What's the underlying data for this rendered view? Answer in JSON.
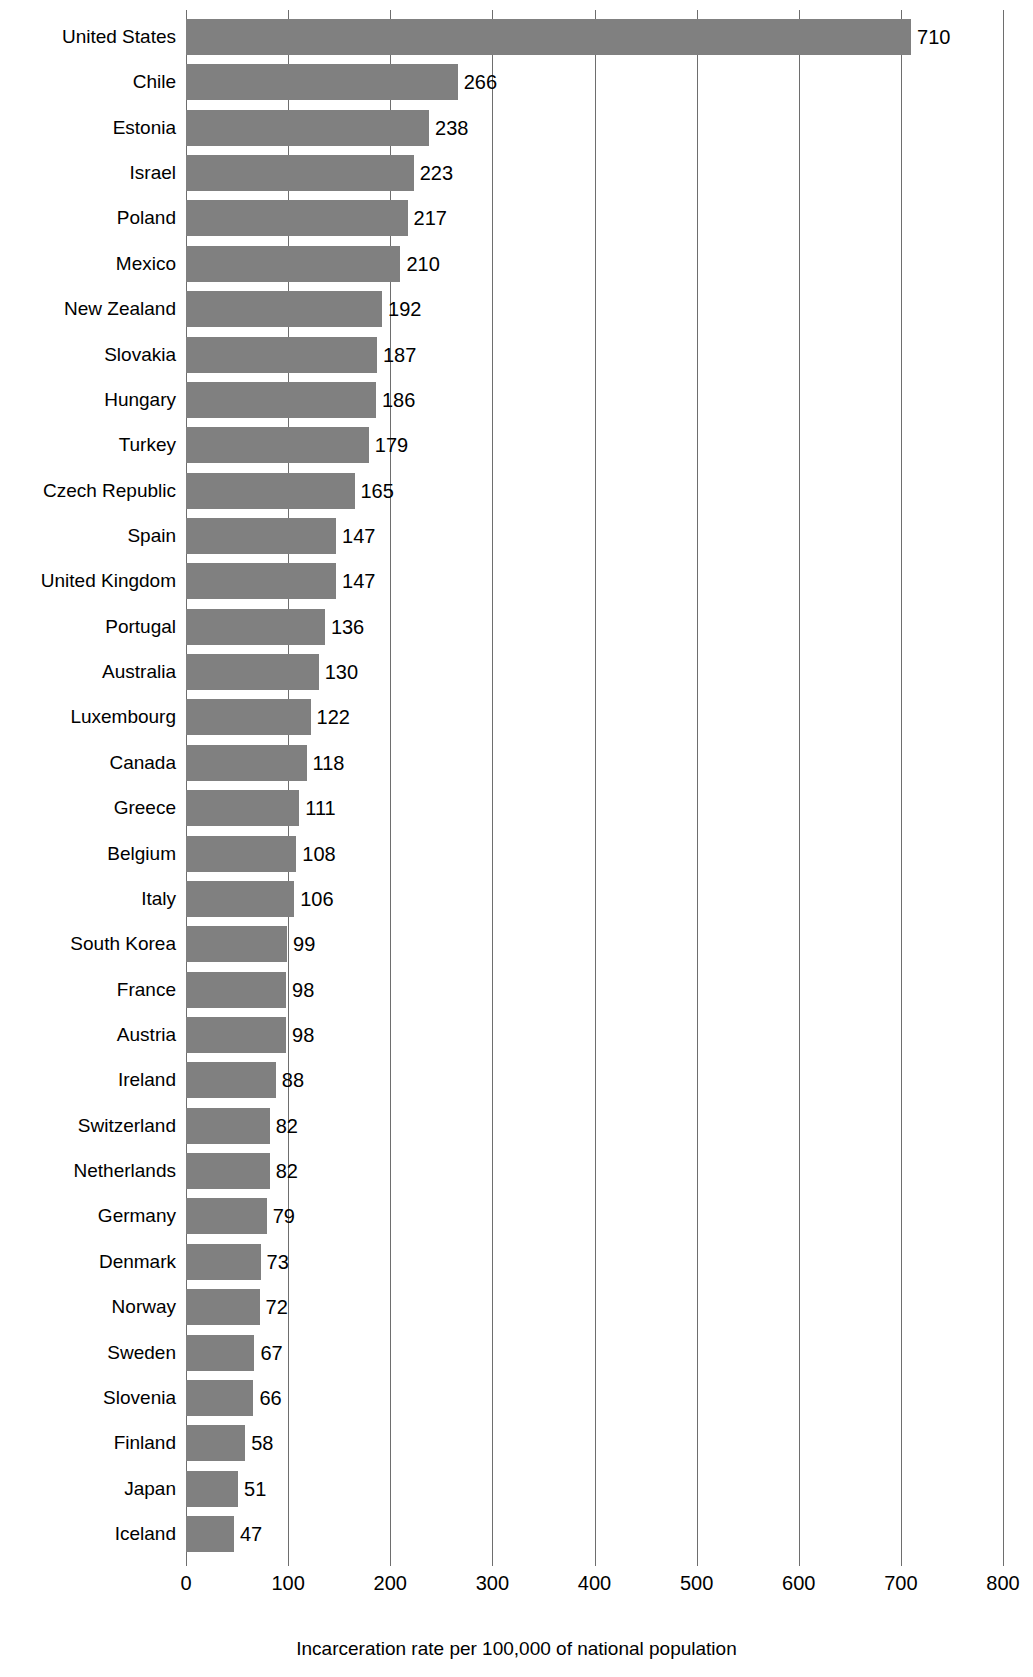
{
  "chart_data": {
    "type": "bar",
    "orientation": "horizontal",
    "title": "",
    "xlabel": "Incarceration rate per 100,000 of national population",
    "ylabel": "Country",
    "xlim": [
      0,
      800
    ],
    "xticks": [
      0,
      100,
      200,
      300,
      400,
      500,
      600,
      700,
      800
    ],
    "grid": "vertical",
    "legend": "none",
    "bar_color": "#808080",
    "gridline_color": "#6e6e6e",
    "background_color": "#ffffff",
    "categories": [
      "United States",
      "Chile",
      "Estonia",
      "Israel",
      "Poland",
      "Mexico",
      "New Zealand",
      "Slovakia",
      "Hungary",
      "Turkey",
      "Czech Republic",
      "Spain",
      "United Kingdom",
      "Portugal",
      "Australia",
      "Luxembourg",
      "Canada",
      "Greece",
      "Belgium",
      "Italy",
      "South Korea",
      "France",
      "Austria",
      "Ireland",
      "Switzerland",
      "Netherlands",
      "Germany",
      "Denmark",
      "Norway",
      "Sweden",
      "Slovenia",
      "Finland",
      "Japan",
      "Iceland"
    ],
    "values": [
      710,
      266,
      238,
      223,
      217,
      210,
      192,
      187,
      186,
      179,
      165,
      147,
      147,
      136,
      130,
      122,
      118,
      111,
      108,
      106,
      99,
      98,
      98,
      88,
      82,
      82,
      79,
      73,
      72,
      67,
      66,
      58,
      51,
      47
    ],
    "value_labels": [
      "710",
      "266",
      "238",
      "223",
      "217",
      "210",
      "192",
      "187",
      "186",
      "179",
      "165",
      "147",
      "147",
      "136",
      "130",
      "122",
      "118",
      "111",
      "108",
      "106",
      "99",
      "98",
      "98",
      "88",
      "82",
      "82",
      "79",
      "73",
      "72",
      "67",
      "66",
      "58",
      "51",
      "47"
    ],
    "xtick_labels": [
      "0",
      "100",
      "200",
      "300",
      "400",
      "500",
      "600",
      "700",
      "800"
    ]
  }
}
